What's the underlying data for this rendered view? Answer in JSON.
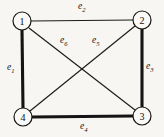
{
  "figure": {
    "type": "undirected-graph-diagram",
    "background_color": "#f7f6f2",
    "line_color": "#141414",
    "width": 164,
    "height": 137
  },
  "nodes": [
    {
      "id": "1",
      "label": "1",
      "cx": 22,
      "cy": 21,
      "r": 9
    },
    {
      "id": "2",
      "label": "2",
      "cx": 142,
      "cy": 20,
      "r": 9
    },
    {
      "id": "3",
      "label": "3",
      "cx": 142,
      "cy": 116,
      "r": 9
    },
    {
      "id": "4",
      "label": "4",
      "cx": 23,
      "cy": 117,
      "r": 9
    }
  ],
  "edges": [
    {
      "id": "e1",
      "label": "e",
      "subscript": "1",
      "from": "1",
      "to": "4",
      "weight": "thick",
      "x1": 22,
      "y1": 30,
      "x2": 23,
      "y2": 108,
      "label_x": 7,
      "label_y": 63
    },
    {
      "id": "e2",
      "label": "e",
      "subscript": "2",
      "from": "1",
      "to": "2",
      "weight": "thin",
      "x1": 31,
      "y1": 21,
      "x2": 133,
      "y2": 20,
      "label_x": 78,
      "label_y": 2
    },
    {
      "id": "e3",
      "label": "e",
      "subscript": "3",
      "from": "2",
      "to": "3",
      "weight": "thick",
      "x1": 142,
      "y1": 29,
      "x2": 142,
      "y2": 107,
      "label_x": 146,
      "label_y": 62
    },
    {
      "id": "e4",
      "label": "e",
      "subscript": "4",
      "from": "4",
      "to": "3",
      "weight": "thick",
      "x1": 32,
      "y1": 117,
      "x2": 133,
      "y2": 116,
      "label_x": 80,
      "label_y": 122
    },
    {
      "id": "e5",
      "label": "e",
      "subscript": "5",
      "from": "2",
      "to": "4",
      "weight": "thin",
      "x1": 135,
      "y1": 26,
      "x2": 30,
      "y2": 111,
      "label_x": 92,
      "label_y": 36
    },
    {
      "id": "e6",
      "label": "e",
      "subscript": "6",
      "from": "1",
      "to": "3",
      "weight": "thin",
      "x1": 29,
      "y1": 28,
      "x2": 135,
      "y2": 110,
      "label_x": 60,
      "label_y": 36
    }
  ]
}
